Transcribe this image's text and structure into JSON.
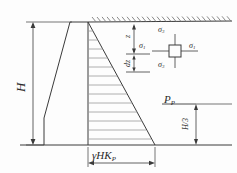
{
  "figure": {
    "colors": {
      "line": "#3a3a3a",
      "hatch": "#8a8a8a",
      "ground": "#6e6e6e",
      "background": "#fdfdfd"
    }
  },
  "labels": {
    "wall_height": "H",
    "depth_z": "z",
    "element_thickness": "dz",
    "sigma_top": "σ",
    "sigma_top_sub": "3",
    "sigma_left": "σ",
    "sigma_left_sub": "1",
    "sigma_right": "σ",
    "sigma_right_sub": "1",
    "sigma_bottom": "σ",
    "sigma_bottom_sub": "3",
    "resultant_force": "P",
    "resultant_force_sub": "P",
    "lever_arm": "H/3",
    "base_pressure": "γHK",
    "base_pressure_sub": "P"
  },
  "geometry": {
    "ground_surface_y": 22,
    "wall_top_y": 22,
    "wall_base_y": 145,
    "wall_back_x": 88,
    "pressure_base_x": 155,
    "hatch_line_count": 13
  }
}
